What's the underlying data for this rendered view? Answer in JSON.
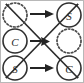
{
  "diagram": {
    "type": "node-mapping",
    "width": 84,
    "height": 83,
    "background_color": "#ffffff",
    "line_color": "#2b2b2b",
    "dashed_color": "#4a4a4a",
    "letter_color": "#2a2a2a",
    "nodes": [
      {
        "id": "left-top",
        "label": "",
        "style": "dashed",
        "filled": false,
        "cx": 15,
        "cy": 15,
        "r": 12
      },
      {
        "id": "left-middle",
        "label": "C",
        "style": "solid",
        "filled": false,
        "cx": 15,
        "cy": 41,
        "r": 12
      },
      {
        "id": "left-bottom",
        "label": "S",
        "style": "solid",
        "filled": false,
        "cx": 15,
        "cy": 68,
        "r": 12
      },
      {
        "id": "right-top",
        "label": "S",
        "style": "solid",
        "filled": false,
        "cx": 69,
        "cy": 15,
        "r": 12
      },
      {
        "id": "right-middle",
        "label": "",
        "style": "dashed",
        "filled": false,
        "cx": 69,
        "cy": 41,
        "r": 12
      },
      {
        "id": "right-bottom",
        "label": "C",
        "style": "solid",
        "filled": false,
        "cx": 69,
        "cy": 68,
        "r": 12
      }
    ],
    "arrows": [
      {
        "id": "arrow-top",
        "from": "left-top",
        "to": "right-top",
        "kind": "horizontal",
        "x1": 30,
        "y1": 14,
        "x2": 54,
        "y2": 14
      },
      {
        "id": "arrow-bottom",
        "from": "left-bottom",
        "to": "right-bottom",
        "kind": "horizontal",
        "x1": 30,
        "y1": 68,
        "x2": 54,
        "y2": 68
      },
      {
        "id": "arrow-center",
        "from": "left-middle",
        "to": "right-middle",
        "kind": "horizontal-short",
        "x1": 30,
        "y1": 41,
        "x2": 48,
        "y2": 41
      }
    ],
    "edges": [
      {
        "id": "diagonal-down",
        "from": "left-top",
        "to": "right-bottom",
        "kind": "diagonal",
        "x1": 6,
        "y1": 4,
        "x2": 78,
        "y2": 78
      },
      {
        "id": "diagonal-up",
        "from": "left-bottom",
        "to": "right-top",
        "kind": "diagonal",
        "x1": 6,
        "y1": 78,
        "x2": 78,
        "y2": 4
      }
    ]
  }
}
